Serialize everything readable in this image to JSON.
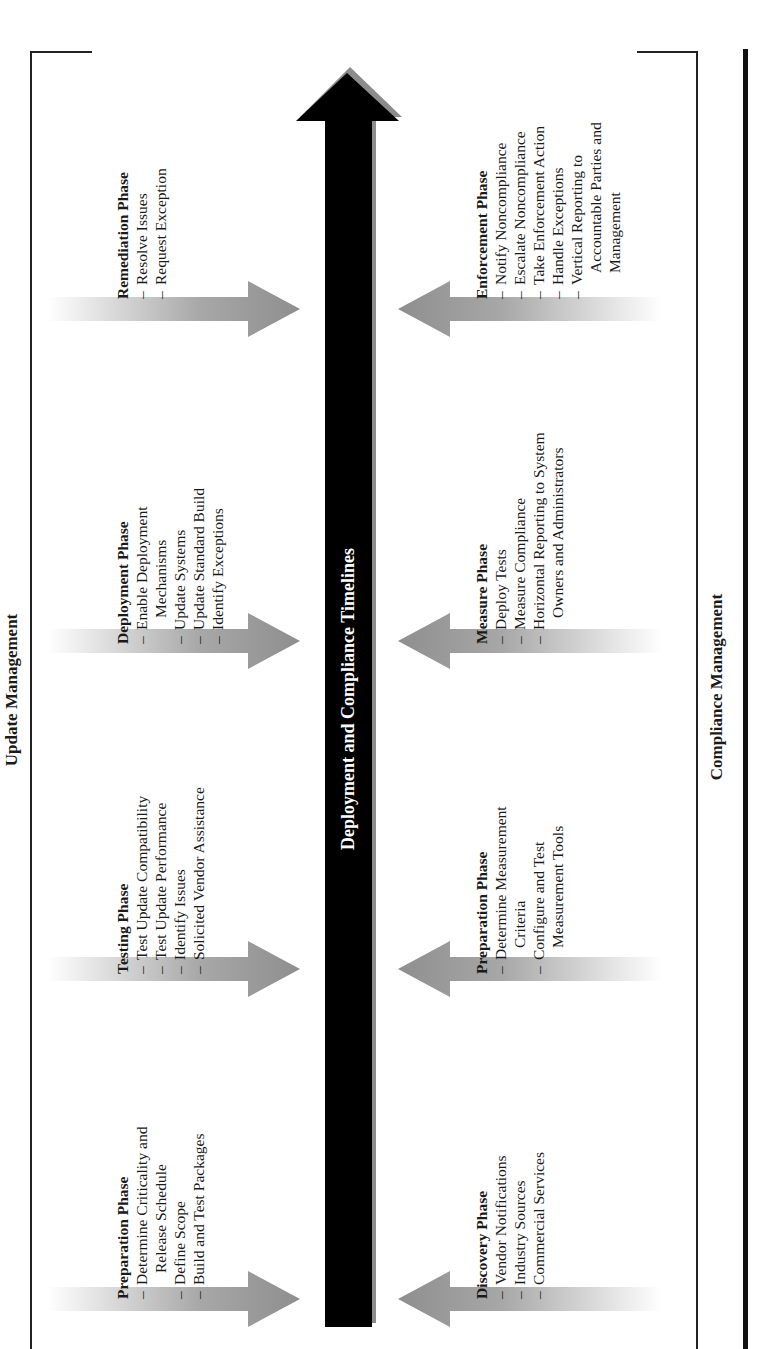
{
  "diagram": {
    "top_section": "Update Management",
    "bottom_section": "Compliance Management",
    "timeline_label": "Deployment and Compliance Timelines",
    "colors": {
      "timeline_bar": "#000000",
      "timeline_shadow": "#8c8c8c",
      "phase_arrow": "#9a9a9a",
      "frame_line": "#222222"
    },
    "update_phases": [
      {
        "title": "Preparation Phase",
        "items": [
          "Determine Criticality and",
          "Release Schedule",
          "Define Scope",
          "Build and Test Packages"
        ],
        "continuations": [
          1
        ]
      },
      {
        "title": "Testing Phase",
        "items": [
          "Test Update Compatibility",
          "Test Update Performance",
          "Identify Issues",
          "Solicited Vendor Assistance"
        ],
        "continuations": []
      },
      {
        "title": "Deployment Phase",
        "items": [
          "Enable Deployment",
          "Mechanisms",
          "Update Systems",
          "Update Standard Build",
          "Identify Exceptions"
        ],
        "continuations": [
          1
        ]
      },
      {
        "title": "Remediation Phase",
        "items": [
          "Resolve Issues",
          "Request Exception"
        ],
        "continuations": []
      }
    ],
    "compliance_phases": [
      {
        "title": "Discovery Phase",
        "items": [
          "Vendor Notifications",
          "Industry Sources",
          "Commercial Services"
        ],
        "continuations": []
      },
      {
        "title": "Preparation Phase",
        "items": [
          "Determine Measurement",
          "Criteria",
          "Configure and Test",
          "Measurement Tools"
        ],
        "continuations": [
          1,
          3
        ]
      },
      {
        "title": "Measure Phase",
        "items": [
          "Deploy Tests",
          "Measure Compliance",
          "Horizontal Reporting to System",
          "Owners and Administrators"
        ],
        "continuations": [
          3
        ]
      },
      {
        "title": "Enforcement Phase",
        "items": [
          "Notify Noncompliance",
          "Escalate Noncompliance",
          "Take Enforcement Action",
          "Handle Exceptions",
          "Vertical Reporting to",
          "Accountable Parties and",
          "Management"
        ],
        "continuations": [
          5,
          6
        ]
      }
    ]
  }
}
